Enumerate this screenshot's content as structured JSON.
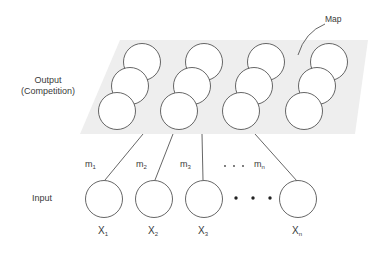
{
  "diagram": {
    "colors": {
      "map_fill": "#eeeeee",
      "stroke": "#555555",
      "text": "#3a3a3a"
    },
    "labels": {
      "map": "Map",
      "output_line1": "Output",
      "output_line2": "(Competition)",
      "input": "Input"
    },
    "weights": [
      {
        "base": "m",
        "sub": "1"
      },
      {
        "base": "m",
        "sub": "2"
      },
      {
        "base": "m",
        "sub": "3"
      },
      {
        "base": "m",
        "sub": "n"
      }
    ],
    "weight_ellipsis": ". . .",
    "inputs": [
      {
        "base": "X",
        "sub": "1"
      },
      {
        "base": "X",
        "sub": "2"
      },
      {
        "base": "X",
        "sub": "3"
      },
      {
        "base": "X",
        "sub": "n"
      }
    ],
    "input_ellipsis": "• • •",
    "output_grid": {
      "columns": 4,
      "rows": 3
    }
  }
}
